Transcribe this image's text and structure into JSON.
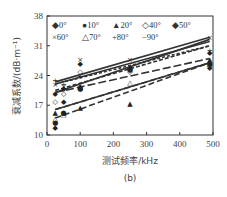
{
  "chart_data": {
    "type": "scatter",
    "title": "",
    "caption": "(b)",
    "xlabel": "测试频率/kHz",
    "ylabel": "衰减系数/(dB·m⁻¹)",
    "xlim": [
      0,
      500
    ],
    "ylim": [
      10,
      38
    ],
    "xticks": [
      0,
      100,
      200,
      300,
      400,
      500
    ],
    "yticks": [
      10,
      17,
      24,
      31,
      38
    ],
    "grid": false,
    "legend_position": "top-left inside",
    "x": [
      25,
      50,
      100,
      250,
      490
    ],
    "series": [
      {
        "name": "0°",
        "marker": "◆",
        "values": [
          12,
          18,
          21.5,
          26,
          26
        ],
        "fit": [
          16,
          27
        ]
      },
      {
        "name": "10°",
        "marker": "●",
        "values": [
          13,
          15.5,
          21,
          25.5,
          27
        ],
        "fit": [
          20,
          32.5
        ]
      },
      {
        "name": "20°",
        "marker": "▲",
        "values": [
          15.5,
          15.5,
          16.5,
          17.5,
          28
        ],
        "fit": [
          14,
          27
        ]
      },
      {
        "name": "40°",
        "marker": "◇",
        "values": [
          18,
          20,
          25,
          25,
          26.5
        ],
        "fit": [
          22,
          32
        ]
      },
      {
        "name": "50°",
        "marker": "◆",
        "values": [
          20,
          21,
          27,
          26,
          29.5
        ],
        "fit": [
          20.5,
          31
        ]
      },
      {
        "name": "60°",
        "marker": "×",
        "values": [
          22,
          21.5,
          28,
          28,
          33
        ],
        "fit": [
          22.5,
          33
        ]
      },
      {
        "name": "70°",
        "marker": "△",
        "values": [
          14,
          15,
          21.5,
          22.5,
          27
        ],
        "fit": [
          16,
          27
        ]
      },
      {
        "name": "80°",
        "marker": "+",
        "values": [
          23,
          22,
          24,
          26,
          30
        ],
        "fit": [
          22,
          31
        ]
      },
      {
        "name": "90°",
        "marker": "−",
        "values": [
          23,
          22,
          24,
          27,
          30
        ],
        "fit": [
          20,
          28
        ]
      }
    ]
  },
  "legend": {
    "row1": [
      "0°",
      "10°",
      "20°",
      "40°",
      "50°"
    ],
    "row2": [
      "60°",
      "70°",
      "80°",
      "90°"
    ]
  }
}
